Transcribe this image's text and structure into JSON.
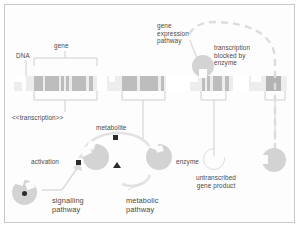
{
  "diagram": {
    "colors": {
      "strand_background": "#ededed",
      "strand_band": "#bdbdbd",
      "molecule_fill": "#d3d3d3",
      "marker_black": "#2b2b2b",
      "line_gray": "#cfcfcf",
      "text_gray": "#4a4a4a",
      "frame_border": "#c9c9c9"
    },
    "labels": {
      "dna": "DNA",
      "gene": "gene",
      "transcription": "<<transcription>>",
      "metabolite": "metabolite",
      "activation": "activation",
      "enzyme": "enzyme",
      "gene_expression_pathway": "gene\nexpression\npathway",
      "gene_expression_pathway_line1": "gene",
      "gene_expression_pathway_line2": "expression",
      "gene_expression_pathway_line3": "pathway",
      "transcription_blocked": "transcription\nblocked by\nenzyme",
      "transcription_blocked_line1": "transcription",
      "transcription_blocked_line2": "blocked by",
      "transcription_blocked_line3": "enzyme",
      "untranscribed_gene_product_line1": "untranscribed",
      "untranscribed_gene_product_line2": "gene product",
      "signalling_pathway_line1": "signalling",
      "signalling_pathway_line2": "pathway",
      "metabolic_pathway_line1": "metabolic",
      "metabolic_pathway_line2": "pathway"
    },
    "markers": {
      "metabolite_symbol": "filled-square",
      "activation_symbol": "filled-square",
      "signalling_symbol": "filled-circle",
      "metabolic_symbol": "filled-triangle"
    },
    "shapes": {
      "enzyme_producer": "pacman-molecule",
      "enzyme": "pacman-molecule",
      "signalling_molecule": "pacman-molecule",
      "blocking_enzyme": "circle-molecule",
      "untranscribed_gene_product": "hollow-pacman-molecule",
      "blocked_gene_product": "pacman-molecule-right"
    }
  }
}
